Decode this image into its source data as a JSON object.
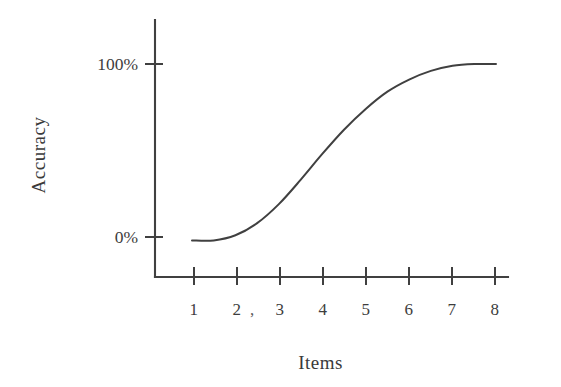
{
  "figure": {
    "background_color": "#ffffff",
    "ink_color": "#404040"
  },
  "chart_data": {
    "type": "line",
    "title": "",
    "subtitle": "",
    "xlabel": "Items",
    "ylabel": "Accuracy",
    "x": [
      1,
      2,
      3,
      4,
      5,
      6,
      7,
      8
    ],
    "xtick_labels": [
      "1",
      "2",
      "3",
      "4",
      "5",
      "6",
      "7",
      "8"
    ],
    "ytick_labels": [
      "0%",
      "100%"
    ],
    "ytick_values": [
      0,
      100
    ],
    "ylim": [
      0,
      100
    ],
    "xlim": [
      1,
      8
    ],
    "grid": false,
    "legend": null,
    "annotations": [
      {
        "text": ",",
        "note": "stray comma artifact between x tick labels 2 and 3"
      }
    ],
    "series": [
      {
        "name": "Accuracy",
        "description": "Sigmoid-shaped learning curve rising from 0% at 1 item to 100% at 8 items",
        "x": [
          1.0,
          1.5,
          2.0,
          2.5,
          3.0,
          3.5,
          4.0,
          4.5,
          5.0,
          5.5,
          6.0,
          6.5,
          7.0,
          7.5,
          8.0
        ],
        "values": [
          -2,
          -2,
          1,
          8,
          19,
          33,
          48,
          62,
          74,
          84,
          91,
          96,
          99,
          100,
          100
        ],
        "color": "#404040",
        "style": "solid"
      }
    ]
  },
  "axes": {
    "y_axis_title": "Accuracy",
    "x_axis_title": "Items",
    "y_labels": [
      {
        "text": "100%",
        "value": 100
      },
      {
        "text": "0%",
        "value": 0
      }
    ],
    "x_labels": [
      {
        "text": "1",
        "value": 1
      },
      {
        "text": "2",
        "value": 2
      },
      {
        "text": "3",
        "value": 3
      },
      {
        "text": "4",
        "value": 4
      },
      {
        "text": "5",
        "value": 5
      },
      {
        "text": "6",
        "value": 6
      },
      {
        "text": "7",
        "value": 7
      },
      {
        "text": "8",
        "value": 8
      }
    ],
    "stray_mark": ","
  }
}
